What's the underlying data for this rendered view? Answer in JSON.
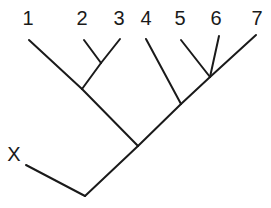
{
  "diagram": {
    "type": "cladogram",
    "line_color": "#1a1a1a",
    "taxa": [
      {
        "id": "1",
        "label": "1",
        "x": 28,
        "y": 18
      },
      {
        "id": "2",
        "label": "2",
        "x": 82,
        "y": 18
      },
      {
        "id": "3",
        "label": "3",
        "x": 119,
        "y": 18
      },
      {
        "id": "4",
        "label": "4",
        "x": 146,
        "y": 18
      },
      {
        "id": "5",
        "label": "5",
        "x": 180,
        "y": 18
      },
      {
        "id": "6",
        "label": "6",
        "x": 216,
        "y": 18
      },
      {
        "id": "7",
        "label": "7",
        "x": 257,
        "y": 18
      },
      {
        "id": "X",
        "label": "X",
        "x": 14,
        "y": 154
      }
    ],
    "edges": [
      {
        "from": [
          84,
          40
        ],
        "to": [
          101,
          63
        ]
      },
      {
        "from": [
          120,
          39
        ],
        "to": [
          101,
          63
        ]
      },
      {
        "from": [
          101,
          63
        ],
        "to": [
          82,
          89
        ]
      },
      {
        "from": [
          29,
          40
        ],
        "to": [
          82,
          89
        ]
      },
      {
        "from": [
          82,
          89
        ],
        "to": [
          138,
          146
        ]
      },
      {
        "from": [
          181,
          40
        ],
        "to": [
          210,
          77
        ]
      },
      {
        "from": [
          219,
          36
        ],
        "to": [
          210,
          77
        ]
      },
      {
        "from": [
          256,
          35
        ],
        "to": [
          210,
          77
        ]
      },
      {
        "from": [
          210,
          77
        ],
        "to": [
          181,
          104
        ]
      },
      {
        "from": [
          146,
          39
        ],
        "to": [
          181,
          104
        ]
      },
      {
        "from": [
          181,
          104
        ],
        "to": [
          138,
          146
        ]
      },
      {
        "from": [
          138,
          146
        ],
        "to": [
          85,
          196
        ]
      },
      {
        "from": [
          26,
          165
        ],
        "to": [
          85,
          196
        ]
      }
    ]
  }
}
